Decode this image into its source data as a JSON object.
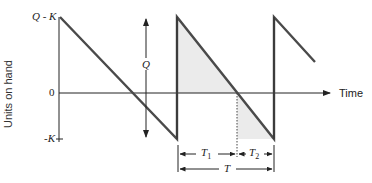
{
  "figure": {
    "type": "inventory-sawtooth-with-backorders",
    "y_axis_label": "Units on hand",
    "x_axis_label": "Time",
    "y_ticks": {
      "top": "Q - K",
      "zero": "0",
      "bottom": "-K"
    },
    "q_arrow_label": "Q",
    "interval_labels": {
      "t1": "T",
      "t1_sub": "1",
      "t2": "T",
      "t2_sub": "2",
      "t": "T"
    },
    "colors": {
      "line": "#4a4a4a",
      "axis": "#222222",
      "shade": "#ebebeb"
    }
  }
}
